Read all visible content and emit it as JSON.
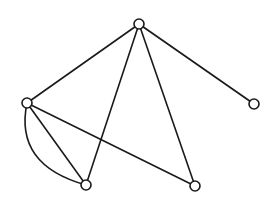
{
  "diagram": {
    "type": "graph",
    "directed": false,
    "colors": {
      "stroke": "#1a1a1a",
      "node_fill": "#ffffff",
      "background": "#ffffff"
    },
    "node_radius": 5,
    "nodes": [
      {
        "id": "top",
        "x": 139,
        "y": 24
      },
      {
        "id": "left",
        "x": 27,
        "y": 103
      },
      {
        "id": "right",
        "x": 254,
        "y": 104
      },
      {
        "id": "bottom-left",
        "x": 86,
        "y": 185
      },
      {
        "id": "bottom-right",
        "x": 195,
        "y": 186
      }
    ],
    "edges": [
      {
        "from": "top",
        "to": "left",
        "shape": "straight"
      },
      {
        "from": "top",
        "to": "right",
        "shape": "straight"
      },
      {
        "from": "top",
        "to": "bottom-left",
        "shape": "straight"
      },
      {
        "from": "top",
        "to": "bottom-right",
        "shape": "straight"
      },
      {
        "from": "left",
        "to": "bottom-left",
        "shape": "straight"
      },
      {
        "from": "left",
        "to": "bottom-left",
        "shape": "curved",
        "control": [
          14,
          165
        ]
      },
      {
        "from": "left",
        "to": "bottom-right",
        "shape": "straight"
      }
    ]
  }
}
